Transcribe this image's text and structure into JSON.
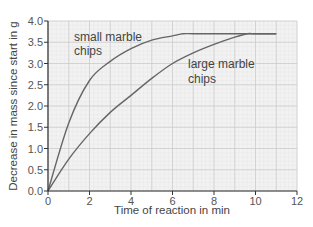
{
  "chart_data": {
    "type": "line",
    "title": "",
    "xlabel": "Time of reaction in min",
    "ylabel": "Decrease in mass since start in g",
    "xlim": [
      0,
      12
    ],
    "ylim": [
      0,
      4.0
    ],
    "x_ticks": [
      "0",
      "2",
      "4",
      "6",
      "8",
      "10",
      "12"
    ],
    "y_ticks": [
      "0.0",
      "0.5",
      "1.0",
      "1.5",
      "2.0",
      "2.5",
      "3.0",
      "3.5",
      "4.0"
    ],
    "grid": true,
    "legend": "none (inline annotations)",
    "series": [
      {
        "name": "small marble chips",
        "annotation_lines": [
          "small marble",
          "chips"
        ],
        "x": [
          0,
          1,
          2,
          3,
          4,
          5,
          6,
          6.5,
          7,
          8,
          9,
          10,
          11
        ],
        "y": [
          0,
          1.6,
          2.6,
          3.05,
          3.35,
          3.55,
          3.65,
          3.7,
          3.7,
          3.7,
          3.7,
          3.7,
          3.7
        ]
      },
      {
        "name": "large marble chips",
        "annotation_lines": [
          "large marble",
          "chips"
        ],
        "x": [
          0,
          1,
          2,
          3,
          4,
          5,
          6,
          7,
          8,
          9,
          9.6,
          10,
          11
        ],
        "y": [
          0,
          0.75,
          1.35,
          1.85,
          2.25,
          2.65,
          3.0,
          3.25,
          3.45,
          3.62,
          3.7,
          3.7,
          3.7
        ]
      }
    ],
    "colors": {
      "line": "#666666",
      "grid_major": "#c8c8c8",
      "grid_minor": "#e6e6e6",
      "plot_bg": "#f2f2f2",
      "axis": "#333333"
    }
  }
}
